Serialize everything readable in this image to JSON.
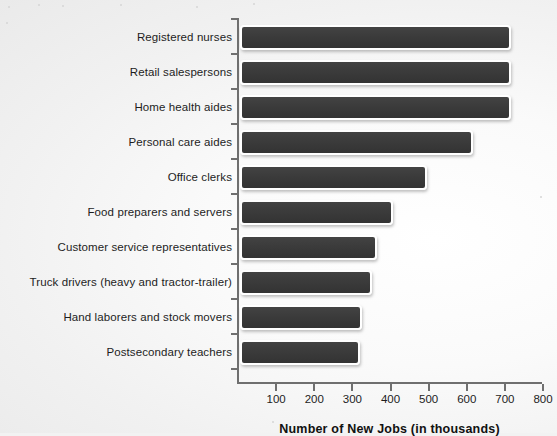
{
  "chart_data": {
    "type": "bar",
    "orientation": "horizontal",
    "title": "",
    "xlabel": "Number of New Jobs (in thousands)",
    "ylabel": "",
    "xlim": [
      0,
      800
    ],
    "xticks": [
      100,
      200,
      300,
      400,
      500,
      600,
      700,
      800
    ],
    "xtick_labels": [
      "100",
      "200",
      "300",
      "400",
      "500",
      "600",
      "700",
      "800"
    ],
    "grid": false,
    "legend": null,
    "bar_color": "#3b3b3b",
    "bar_edge_color": "#ffffff",
    "background_color": "#f2f2f2",
    "axis_color": "#6f6f6f",
    "categories": [
      "Registered nurses",
      "Retail salespersons",
      "Home health aides",
      "Personal care aides",
      "Office clerks",
      "Food preparers and servers",
      "Customer service representatives",
      "Truck drivers (heavy and tractor-trailer)",
      "Hand laborers and stock movers",
      "Postsecondary teachers"
    ],
    "values": [
      710,
      710,
      710,
      610,
      490,
      400,
      360,
      345,
      320,
      315
    ]
  }
}
